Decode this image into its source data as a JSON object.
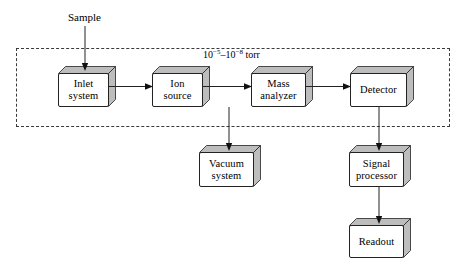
{
  "diagram": {
    "labels": {
      "sample": "Sample",
      "pressure_prefix": "10",
      "pressure_exp_high": "−5",
      "pressure_mid": "–10",
      "pressure_exp_low": "−8",
      "pressure_unit": " torr",
      "pressure_full": "10⁻⁵–10⁻⁸ torr"
    },
    "blocks": [
      {
        "id": "inlet-system",
        "label": "Inlet\nsystem",
        "x": 58,
        "y": 66,
        "w": 58,
        "h": 41
      },
      {
        "id": "ion-source",
        "label": "Ion\nsource",
        "x": 152,
        "y": 66,
        "w": 58,
        "h": 41
      },
      {
        "id": "mass-analyzer",
        "label": "Mass\nanalyzer",
        "x": 251,
        "y": 66,
        "w": 62,
        "h": 41
      },
      {
        "id": "detector",
        "label": "Detector",
        "x": 350,
        "y": 66,
        "w": 64,
        "h": 41
      },
      {
        "id": "vacuum-system",
        "label": "Vacuum\nsystem",
        "x": 199,
        "y": 145,
        "w": 62,
        "h": 42
      },
      {
        "id": "signal-processor",
        "label": "Signal\nprocessor",
        "x": 349,
        "y": 145,
        "w": 62,
        "h": 42
      },
      {
        "id": "readout",
        "label": "Readout",
        "x": 349,
        "y": 218,
        "w": 62,
        "h": 40
      }
    ],
    "envelope": {
      "x": 16,
      "y": 48,
      "w": 434,
      "h": 79,
      "style": "dashed"
    },
    "connections": [
      {
        "id": "sample-to-inlet",
        "from": "Sample",
        "to": "Inlet system",
        "direction": "down"
      },
      {
        "id": "inlet-to-ion-source",
        "from": "Inlet system",
        "to": "Ion source",
        "direction": "right"
      },
      {
        "id": "ion-source-to-mass-analyzer",
        "from": "Ion source",
        "to": "Mass analyzer",
        "direction": "right"
      },
      {
        "id": "mass-analyzer-to-detector",
        "from": "Mass analyzer",
        "to": "Detector",
        "direction": "right"
      },
      {
        "id": "envelope-to-vacuum-system",
        "from": "Vacuum envelope",
        "to": "Vacuum system",
        "direction": "down"
      },
      {
        "id": "detector-to-signal",
        "from": "Detector",
        "to": "Signal processor",
        "direction": "down"
      },
      {
        "id": "signal-to-readout",
        "from": "Signal processor",
        "to": "Readout",
        "direction": "down"
      }
    ],
    "colors": {
      "stroke": "#222222",
      "dashed_stroke": "#3a3a3a",
      "face_front": "#ffffff",
      "face_shade": "#bdbdbd",
      "background": "#ffffff"
    }
  }
}
